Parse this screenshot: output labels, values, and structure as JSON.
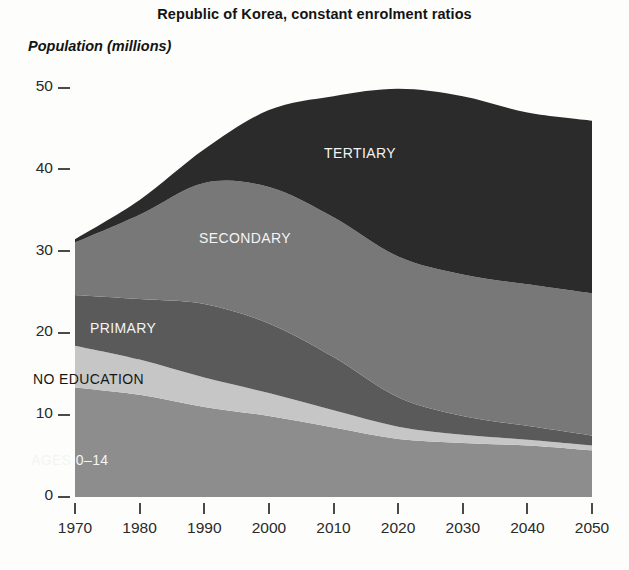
{
  "title": "Republic of Korea, constant enrolment ratios",
  "y_axis_label": "Population (millions)",
  "axis": {
    "y_ticks": [
      "0",
      "10",
      "20",
      "30",
      "40",
      "50"
    ],
    "x_ticks": [
      "1970",
      "1980",
      "1990",
      "2000",
      "2010",
      "2020",
      "2030",
      "2040",
      "2050"
    ]
  },
  "series_labels": {
    "tertiary": "TERTIARY",
    "secondary": "SECONDARY",
    "primary": "PRIMARY",
    "no_education": "NO EDUCATION",
    "ages": "AGES 0–14"
  },
  "colors": {
    "ages_0_14": "#8d8d8d",
    "no_education": "#c6c6c6",
    "primary": "#5a5a5a",
    "secondary": "#787878",
    "tertiary": "#2b2b2b",
    "background": "#fdfdfc",
    "axis": "#4a4a4a",
    "text": "#1a1a1a"
  },
  "chart_data": {
    "type": "area",
    "stacked": true,
    "title": "Republic of Korea, constant enrolment ratios",
    "xlabel": "",
    "ylabel": "Population (millions)",
    "xlim": [
      1970,
      2050
    ],
    "ylim": [
      0,
      50
    ],
    "grid": false,
    "legend": "in-plot area labels",
    "x": [
      1970,
      1980,
      1990,
      2000,
      2010,
      2020,
      2030,
      2040,
      2050
    ],
    "series": [
      {
        "name": "AGES 0–14",
        "color": "#8d8d8d",
        "values": [
          13.4,
          12.5,
          11.0,
          9.9,
          8.5,
          7.1,
          6.6,
          6.3,
          5.7
        ]
      },
      {
        "name": "NO EDUCATION",
        "color": "#c6c6c6",
        "values": [
          5.1,
          4.3,
          3.6,
          2.8,
          2.1,
          1.5,
          1.0,
          0.7,
          0.6
        ]
      },
      {
        "name": "PRIMARY",
        "color": "#5a5a5a",
        "values": [
          6.2,
          7.4,
          9.0,
          8.5,
          6.5,
          3.6,
          2.3,
          1.7,
          1.2
        ]
      },
      {
        "name": "SECONDARY",
        "color": "#787878",
        "values": [
          6.4,
          10.3,
          14.8,
          16.7,
          17.1,
          17.2,
          17.3,
          17.3,
          17.4
        ]
      },
      {
        "name": "TERTIARY",
        "color": "#2b2b2b",
        "values": [
          0.4,
          1.8,
          4.1,
          9.4,
          14.8,
          20.5,
          21.8,
          21.0,
          21.1
        ]
      }
    ],
    "totals": [
      31.5,
      36.3,
      42.5,
      47.3,
      49.0,
      49.9,
      49.0,
      47.0,
      46.0
    ],
    "annotations": [
      {
        "text": "TERTIARY",
        "x": 2013,
        "y": 41
      },
      {
        "text": "SECONDARY",
        "x": 1995,
        "y": 31
      },
      {
        "text": "PRIMARY",
        "x": 1980,
        "y": 20.5
      },
      {
        "text": "NO EDUCATION",
        "x": 1979,
        "y": 15
      },
      {
        "text": "AGES 0–14",
        "x": 1978,
        "y": 4
      }
    ]
  }
}
